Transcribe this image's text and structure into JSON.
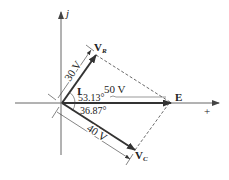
{
  "diagram": {
    "type": "phasor-diagram",
    "axes": {
      "imag_label": "j",
      "real_label": "+"
    },
    "phasors": [
      {
        "id": "E",
        "label": "E",
        "magnitude_label": "50 V",
        "angle_deg": 0
      },
      {
        "id": "VR",
        "label": "V",
        "subscript": "R",
        "magnitude_label": "30 V",
        "angle_label": "53.13°",
        "angle_deg": 53.13
      },
      {
        "id": "VC",
        "label": "V",
        "subscript": "C",
        "magnitude_label": "40 V",
        "angle_label": "36.87°",
        "angle_deg": -36.87
      },
      {
        "id": "I",
        "label": "I",
        "angle_deg": 53.13
      }
    ],
    "colors": {
      "axis": "#555555",
      "phasor": "#333333",
      "dashed": "#444444",
      "text": "#222222"
    }
  }
}
